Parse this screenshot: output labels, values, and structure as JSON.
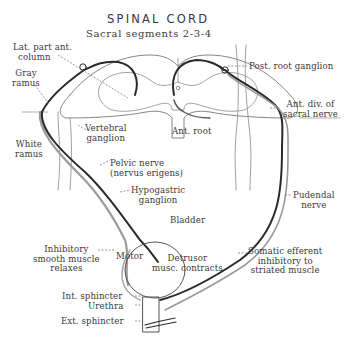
{
  "title": "SPINAL CORD",
  "subtitle": "Sacral segments 2-3-4",
  "labels": {
    "lat_part_ant_column": [
      "Lat. part ant.",
      "column"
    ],
    "gray_ramus": [
      "Gray",
      "ramus"
    ],
    "white_ramus": [
      "White",
      "ramus"
    ],
    "post_root_ganglion": "Post. root ganglion",
    "ant_div_sacral_nerve": [
      "Ant. div. of",
      "sacral nerve"
    ],
    "vertebral_ganglion": [
      "Vertebral",
      "ganglion"
    ],
    "ant_root": "Ant. root",
    "pelvic_nerve": [
      "Pelvic nerve",
      "(nervus erigens)"
    ],
    "hypogastric_ganglion": [
      "Hypogastric",
      "ganglion"
    ],
    "pudendal_nerve": [
      "Pudendal",
      "nerve"
    ],
    "bladder": "Bladder",
    "inhibitory_smooth_muscle": [
      "Inhibitory",
      "smooth muscle",
      "relaxes"
    ],
    "motor": "Motor",
    "detrusor": [
      "Detrusor",
      "musc. contracts"
    ],
    "somatic_efferent": [
      "Somatic efferent",
      "inhibitory to",
      "striated muscle"
    ],
    "int_sphincter": "Int. sphincter",
    "urethra": "Urethra",
    "ext_sphincter": "Ext. sphincter"
  },
  "colors": {
    "ink": "#2a2a2a",
    "gray_pathway": "#9a9a9a",
    "outline": "#6a6a6a",
    "background": "#ffffff"
  }
}
